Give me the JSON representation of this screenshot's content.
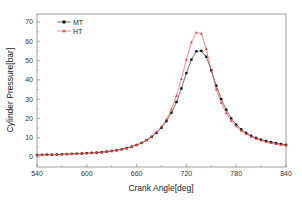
{
  "chart_data": {
    "type": "line",
    "title": "",
    "xlabel": "Crank Angle[deg]",
    "ylabel": "Cylinder Pressure[bar]",
    "xlim": [
      540,
      840
    ],
    "ylim": [
      -5,
      75
    ],
    "xticks": [
      540,
      600,
      660,
      720,
      780,
      840
    ],
    "yticks": [
      0,
      10,
      20,
      30,
      40,
      50,
      60,
      70
    ],
    "grid": false,
    "legend_position": "upper-left",
    "series": [
      {
        "name": "MT",
        "color": "#111111",
        "marker": "square",
        "x": [
          540,
          546,
          552,
          558,
          564,
          570,
          576,
          582,
          588,
          594,
          600,
          606,
          612,
          618,
          624,
          630,
          636,
          642,
          648,
          654,
          660,
          666,
          672,
          678,
          684,
          690,
          696,
          702,
          708,
          714,
          720,
          726,
          732,
          738,
          744,
          750,
          756,
          762,
          768,
          774,
          780,
          786,
          792,
          798,
          804,
          810,
          816,
          822,
          828,
          834,
          840
        ],
        "y": [
          1.0,
          1.1,
          1.2,
          1.2,
          1.3,
          1.4,
          1.5,
          1.6,
          1.7,
          1.8,
          2.0,
          2.1,
          2.3,
          2.5,
          2.8,
          3.1,
          3.5,
          4.0,
          4.6,
          5.3,
          6.2,
          7.3,
          8.7,
          10.4,
          12.5,
          15.2,
          18.6,
          23.0,
          28.5,
          35.5,
          43.5,
          50.5,
          54.8,
          55.0,
          52.0,
          45.0,
          37.0,
          30.0,
          24.5,
          20.0,
          16.8,
          14.3,
          12.5,
          11.0,
          9.9,
          9.0,
          8.3,
          7.7,
          7.2,
          6.7,
          6.3
        ]
      },
      {
        "name": "HT",
        "color": "#e8403a",
        "marker": "triangle",
        "x": [
          540,
          546,
          552,
          558,
          564,
          570,
          576,
          582,
          588,
          594,
          600,
          606,
          612,
          618,
          624,
          630,
          636,
          642,
          648,
          654,
          660,
          666,
          672,
          678,
          684,
          690,
          696,
          702,
          708,
          714,
          720,
          726,
          732,
          738,
          744,
          750,
          756,
          762,
          768,
          774,
          780,
          786,
          792,
          798,
          804,
          810,
          816,
          822,
          828,
          834,
          840
        ],
        "y": [
          1.0,
          1.1,
          1.2,
          1.2,
          1.3,
          1.4,
          1.5,
          1.6,
          1.7,
          1.8,
          2.0,
          2.1,
          2.3,
          2.5,
          2.8,
          3.1,
          3.5,
          4.0,
          4.6,
          5.3,
          6.2,
          7.3,
          8.8,
          10.6,
          12.9,
          15.8,
          19.6,
          24.8,
          31.8,
          40.5,
          50.5,
          59.5,
          64.5,
          64.0,
          56.0,
          44.5,
          35.0,
          28.0,
          22.8,
          18.8,
          15.9,
          13.6,
          11.9,
          10.5,
          9.4,
          8.5,
          7.8,
          7.2,
          6.7,
          6.3,
          5.9
        ]
      }
    ]
  }
}
